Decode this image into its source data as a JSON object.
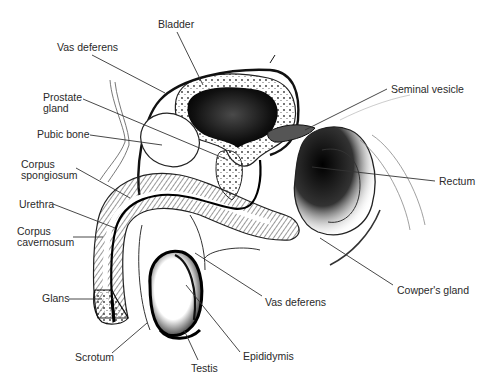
{
  "diagram": {
    "colors": {
      "background": "#ffffff",
      "ink": "#1a1a1a",
      "label": "#2a2a2a",
      "leader": "#333333"
    },
    "labels": [
      {
        "id": "bladder",
        "text": "Bladder",
        "x": 158,
        "y": 19
      },
      {
        "id": "vas-deferens-top",
        "text": "Vas deferens",
        "x": 57,
        "y": 42
      },
      {
        "id": "prostate-gland",
        "text": "Prostate\ngland",
        "x": 43,
        "y": 92
      },
      {
        "id": "pubic-bone",
        "text": "Pubic bone",
        "x": 37,
        "y": 129
      },
      {
        "id": "corpus-spongiosum",
        "text": "Corpus\nspongiosum",
        "x": 21,
        "y": 159
      },
      {
        "id": "urethra",
        "text": "Urethra",
        "x": 19,
        "y": 199
      },
      {
        "id": "corpus-cavernosum",
        "text": "Corpus\ncavernosum",
        "x": 17,
        "y": 226
      },
      {
        "id": "glans",
        "text": "Glans",
        "x": 42,
        "y": 293
      },
      {
        "id": "scrotum",
        "text": "Scrotum",
        "x": 75,
        "y": 352
      },
      {
        "id": "testis",
        "text": "Testis",
        "x": 191,
        "y": 363
      },
      {
        "id": "epididymis",
        "text": "Epididymis",
        "x": 243,
        "y": 351
      },
      {
        "id": "vas-deferens-bottom",
        "text": "Vas deferens",
        "x": 265,
        "y": 297
      },
      {
        "id": "cowpers-gland",
        "text": "Cowper's gland",
        "x": 397,
        "y": 285
      },
      {
        "id": "rectum",
        "text": "Rectum",
        "x": 439,
        "y": 176
      },
      {
        "id": "seminal-vesicle",
        "text": "Seminal vesicle",
        "x": 391,
        "y": 84
      }
    ],
    "leaders": [
      {
        "id": "bladder",
        "x1": 177,
        "y1": 32,
        "x2": 203,
        "y2": 85
      },
      {
        "id": "vas-deferens-top",
        "x1": 92,
        "y1": 55,
        "x2": 165,
        "y2": 93
      },
      {
        "id": "prostate-gland",
        "x1": 83,
        "y1": 99,
        "x2": 228,
        "y2": 160
      },
      {
        "id": "pubic-bone",
        "x1": 90,
        "y1": 135,
        "x2": 162,
        "y2": 145
      },
      {
        "id": "corpus-spongiosum",
        "x1": 76,
        "y1": 168,
        "x2": 130,
        "y2": 198
      },
      {
        "id": "urethra",
        "x1": 53,
        "y1": 204,
        "x2": 115,
        "y2": 228
      },
      {
        "id": "corpus-cavernosum",
        "x1": 73,
        "y1": 237,
        "x2": 103,
        "y2": 237
      },
      {
        "id": "glans",
        "x1": 69,
        "y1": 299,
        "x2": 102,
        "y2": 299
      },
      {
        "id": "scrotum",
        "x1": 112,
        "y1": 353,
        "x2": 147,
        "y2": 323
      },
      {
        "id": "testis",
        "x1": 198,
        "y1": 360,
        "x2": 184,
        "y2": 330
      },
      {
        "id": "epididymis",
        "x1": 240,
        "y1": 352,
        "x2": 186,
        "y2": 285
      },
      {
        "id": "vas-deferens-bottom",
        "x1": 262,
        "y1": 296,
        "x2": 195,
        "y2": 253
      },
      {
        "id": "cowpers-gland",
        "x1": 393,
        "y1": 285,
        "x2": 320,
        "y2": 238
      },
      {
        "id": "rectum",
        "x1": 435,
        "y1": 181,
        "x2": 312,
        "y2": 167
      },
      {
        "id": "seminal-vesicle",
        "x1": 387,
        "y1": 89,
        "x2": 305,
        "y2": 130
      }
    ]
  }
}
